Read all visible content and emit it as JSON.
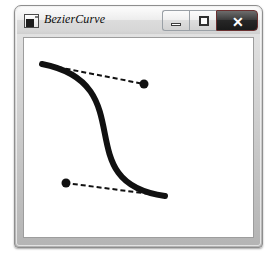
{
  "window": {
    "title": "BezierCurve",
    "icon": "form-window-icon",
    "controls": [
      {
        "name": "minimize-button",
        "label": "–",
        "glyph": "minimize-icon"
      },
      {
        "name": "maximize-button",
        "label": "□",
        "glyph": "maximize-icon"
      },
      {
        "name": "close-button",
        "label": "✕",
        "glyph": "close-icon"
      }
    ],
    "colors": {
      "title_bar_top": "#fbfbfb",
      "title_bar_bottom": "#cfcfcf",
      "frame": "#c2c2c2",
      "frame_border": "#8e8e8e",
      "close_button_bg": "#262626",
      "client_background": "#ffffff",
      "curve_stroke": "#111111",
      "tangent_stroke": "#111111"
    }
  },
  "canvas": {
    "name": "bezier-curve-drawing",
    "width": 229,
    "height": 199,
    "curve": {
      "type": "cubic-bezier",
      "start": {
        "x": 18,
        "y": 26
      },
      "control1": {
        "x": 120,
        "y": 46
      },
      "control2": {
        "x": 42,
        "y": 145
      },
      "end": {
        "x": 141,
        "y": 158
      },
      "stroke_width": 6,
      "stroke_color": "#111111",
      "line_cap": "round"
    },
    "tangent_handles": [
      {
        "name": "start-tangent",
        "from": {
          "x": 18,
          "y": 26
        },
        "to": {
          "x": 120,
          "y": 46
        },
        "dash": "5,3",
        "stroke_width": 2,
        "handle_point": {
          "x": 120,
          "y": 46
        },
        "handle_radius": 4.5
      },
      {
        "name": "end-tangent",
        "from": {
          "x": 141,
          "y": 158
        },
        "to": {
          "x": 42,
          "y": 145
        },
        "dash": "5,3",
        "stroke_width": 2,
        "handle_point": {
          "x": 42,
          "y": 145
        },
        "handle_radius": 4.5
      }
    ]
  }
}
